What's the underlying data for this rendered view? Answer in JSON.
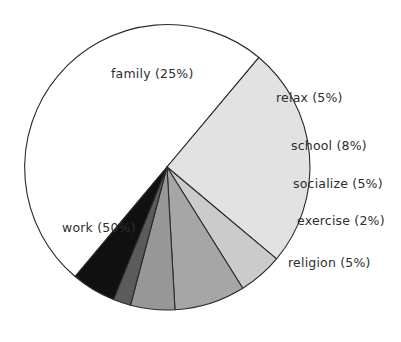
{
  "chart_data": {
    "type": "pie",
    "title": "",
    "subtitle": "",
    "xlabel": "",
    "ylabel": "",
    "legend_position": "none",
    "grid": false,
    "labels_inline": true,
    "total_percent": 100,
    "categories": [
      "work",
      "family",
      "relax",
      "school",
      "socialize",
      "exercise",
      "religion"
    ],
    "values": [
      50,
      25,
      5,
      8,
      5,
      2,
      5
    ],
    "slices": [
      {
        "name": "work",
        "value": 50,
        "percent_text": "50%",
        "label": "work  (50%)",
        "color": "#ffffff",
        "start_angle": 130,
        "end_angle": 310
      },
      {
        "name": "family",
        "value": 25,
        "percent_text": "25%",
        "label": "family  (25%)",
        "color": "#e2e2e2",
        "start_angle": -50,
        "end_angle": 40
      },
      {
        "name": "relax",
        "value": 5,
        "percent_text": "5%",
        "label": "relax  (5%)",
        "color": "#cbcbcb",
        "start_angle": 40,
        "end_angle": 58
      },
      {
        "name": "school",
        "value": 8,
        "percent_text": "8%",
        "label": "school  (8%)",
        "color": "#a6a6a6",
        "start_angle": 58,
        "end_angle": 86.8
      },
      {
        "name": "socialize",
        "value": 5,
        "percent_text": "5%",
        "label": "socialize  (5%)",
        "color": "#979797",
        "start_angle": 86.8,
        "end_angle": 104.8
      },
      {
        "name": "exercise",
        "value": 2,
        "percent_text": "2%",
        "label": "exercise  (2%)",
        "color": "#5b5b5b",
        "start_angle": 104.8,
        "end_angle": 112
      },
      {
        "name": "religion",
        "value": 5,
        "percent_text": "5%",
        "label": "religion  (5%)",
        "color": "#101010",
        "start_angle": 112,
        "end_angle": 130
      }
    ],
    "geometry": {
      "center_x": 167,
      "center_y": 167,
      "radius": 143,
      "outline_color": "#2b2b2b"
    },
    "label_positions": [
      {
        "name": "work",
        "left": 62,
        "top": 222
      },
      {
        "name": "family",
        "left": 111,
        "top": 68
      },
      {
        "name": "relax",
        "left": 276,
        "top": 92
      },
      {
        "name": "school",
        "left": 291,
        "top": 140
      },
      {
        "name": "socialize",
        "left": 293,
        "top": 178
      },
      {
        "name": "exercise",
        "left": 297,
        "top": 215
      },
      {
        "name": "religion",
        "left": 288,
        "top": 257
      }
    ]
  }
}
